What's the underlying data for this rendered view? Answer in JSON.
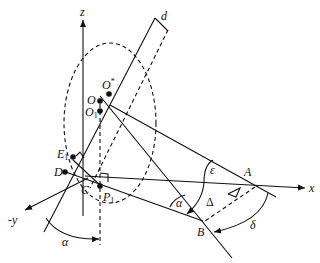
{
  "diagram": {
    "type": "3D geometric construction diagram",
    "axes": {
      "z": "z",
      "x": "x",
      "neg_y": "-y"
    },
    "points": {
      "O_star": {
        "base": "O",
        "sup": "*"
      },
      "O": {
        "base": "O"
      },
      "O1": {
        "base": "O",
        "sub": "1"
      },
      "E1": {
        "base": "E",
        "sub": "1"
      },
      "D": {
        "base": "D"
      },
      "C": {
        "base": "C"
      },
      "P1": {
        "base": "P",
        "sub": "1"
      },
      "A": {
        "base": "A"
      },
      "B": {
        "base": "B"
      }
    },
    "dimensions": {
      "d": "d"
    },
    "angles": {
      "alpha_bottom": "α",
      "alpha_right": "α",
      "epsilon": "ε",
      "delta_upper": "Δ",
      "delta_lower": "δ"
    },
    "colors": {
      "stroke": "#111111",
      "background": "#ffffff"
    }
  }
}
